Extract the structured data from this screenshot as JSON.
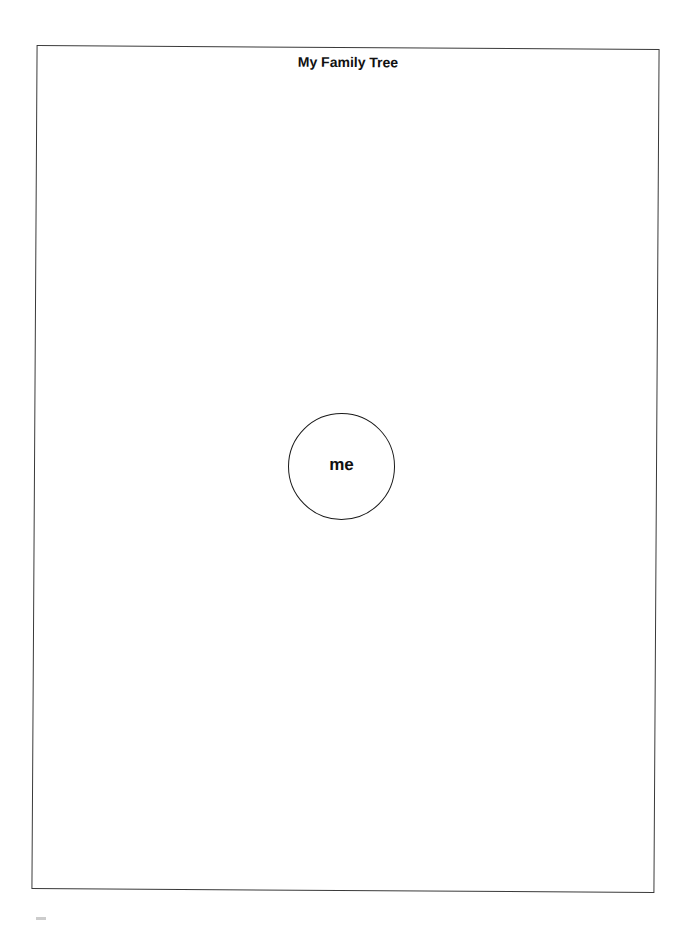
{
  "worksheet": {
    "title": "My Family Tree",
    "center_node": {
      "label": "me"
    }
  }
}
